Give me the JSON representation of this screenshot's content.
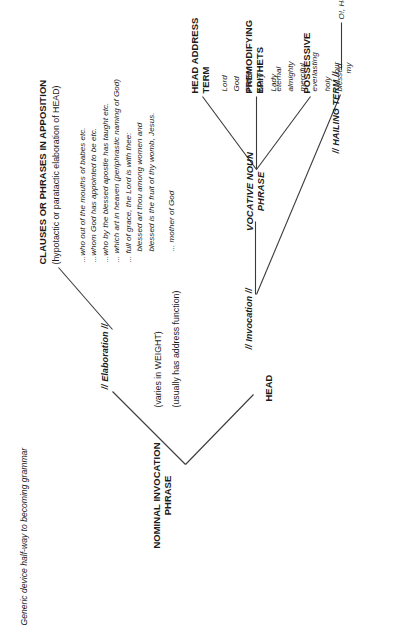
{
  "diagram": {
    "title": "Generic device half-way to becoming grammar",
    "type": "linguistic-tree",
    "orientation": "rotated-90-ccw",
    "root": {
      "label_line1": "NOMINAL INVOCATION",
      "label_line2": "PHRASE",
      "notes": [
        "(varies in WEIGHT)",
        "(usually has address function)"
      ]
    },
    "branches": {
      "head": {
        "label": "HEAD",
        "child_label": "// Invocation //",
        "vocative": {
          "label_line1": "VOCATIVE NOUN",
          "label_line2": "PHRASE",
          "columns": [
            {
              "header_line1": "POSSESSIVE",
              "header_line2": "",
              "items": [
                "our",
                "my"
              ]
            },
            {
              "header_line1": "PREMODIFYING",
              "header_line2": "EPITHETS",
              "items": [
                "eternal",
                "almighty",
                "merciful",
                "everlasting",
                "holy",
                "blessed"
              ]
            },
            {
              "header_line1": "HEAD ADDRESS",
              "header_line2": "TERM",
              "items": [
                "Lord",
                "God",
                "Father",
                "Mary",
                "Lady"
              ]
            }
          ]
        },
        "hailing": {
          "label": "// HAILING TERM  //",
          "examples": "O!, Hail !"
        }
      },
      "elaboration": {
        "label": "// Elaboration  //",
        "apposition": {
          "header": "CLAUSES OR PHRASES IN APPOSITION",
          "subheader": "(hypotactic or paratactic elaboration of HEAD)",
          "examples": [
            "...who out of the mouths of babes etc.",
            "...whom God has appointed to be etc.",
            "...who by the blessed apostle has taught etc.",
            "... which art in heaven (periphrastic naming of God)",
            "... full of grace, the Lord is with thee:",
            "blessed art thou among women and",
            "blessed is the fruit of thy womb, Jesus.",
            "... mother of God"
          ]
        }
      }
    }
  }
}
